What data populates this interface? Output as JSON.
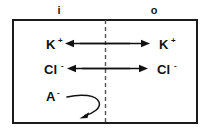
{
  "diagram": {
    "background_color": "#ffffff",
    "line_color": "#111111",
    "membrane_color": "#555555",
    "box_border_color": "#1b1b1b",
    "compartments": {
      "inside": {
        "label": "i",
        "name": "intracellular-compartment"
      },
      "outside": {
        "label": "o",
        "name": "extracellular-compartment"
      }
    },
    "membrane": {
      "label": "",
      "style": "dashed"
    },
    "rows": [
      {
        "id": "potassium",
        "inside_label": "K",
        "inside_charge": "+",
        "outside_label": "K",
        "outside_charge": "+",
        "flux": "bidirectional",
        "permeant": true
      },
      {
        "id": "chloride",
        "inside_label": "Cl",
        "inside_charge": "-",
        "outside_label": "Cl",
        "outside_charge": "-",
        "flux": "bidirectional",
        "permeant": true
      },
      {
        "id": "impermeant-anion",
        "inside_label": "A",
        "inside_charge": "-",
        "outside_label": "",
        "outside_charge": "",
        "flux": "blocked-curved",
        "permeant": false
      }
    ]
  }
}
